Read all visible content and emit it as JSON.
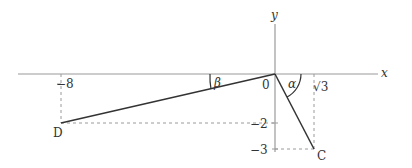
{
  "diagram": {
    "axes": {
      "x_label": "x",
      "y_label": "y",
      "origin_label": "0"
    },
    "ticks": {
      "x_neg8": "−8",
      "x_sqrt3": "√3",
      "y_neg2": "−2",
      "y_neg3": "−3"
    },
    "points": {
      "D": {
        "label": "D",
        "x": -8,
        "y": -2
      },
      "C": {
        "label": "C",
        "x": "√3",
        "y": -3
      }
    },
    "angles": {
      "alpha": "α",
      "beta": "β"
    },
    "colors": {
      "axis": "#9a9a9a",
      "segment": "#333333",
      "guide": "#9a9a9a",
      "text": "#333333"
    }
  }
}
